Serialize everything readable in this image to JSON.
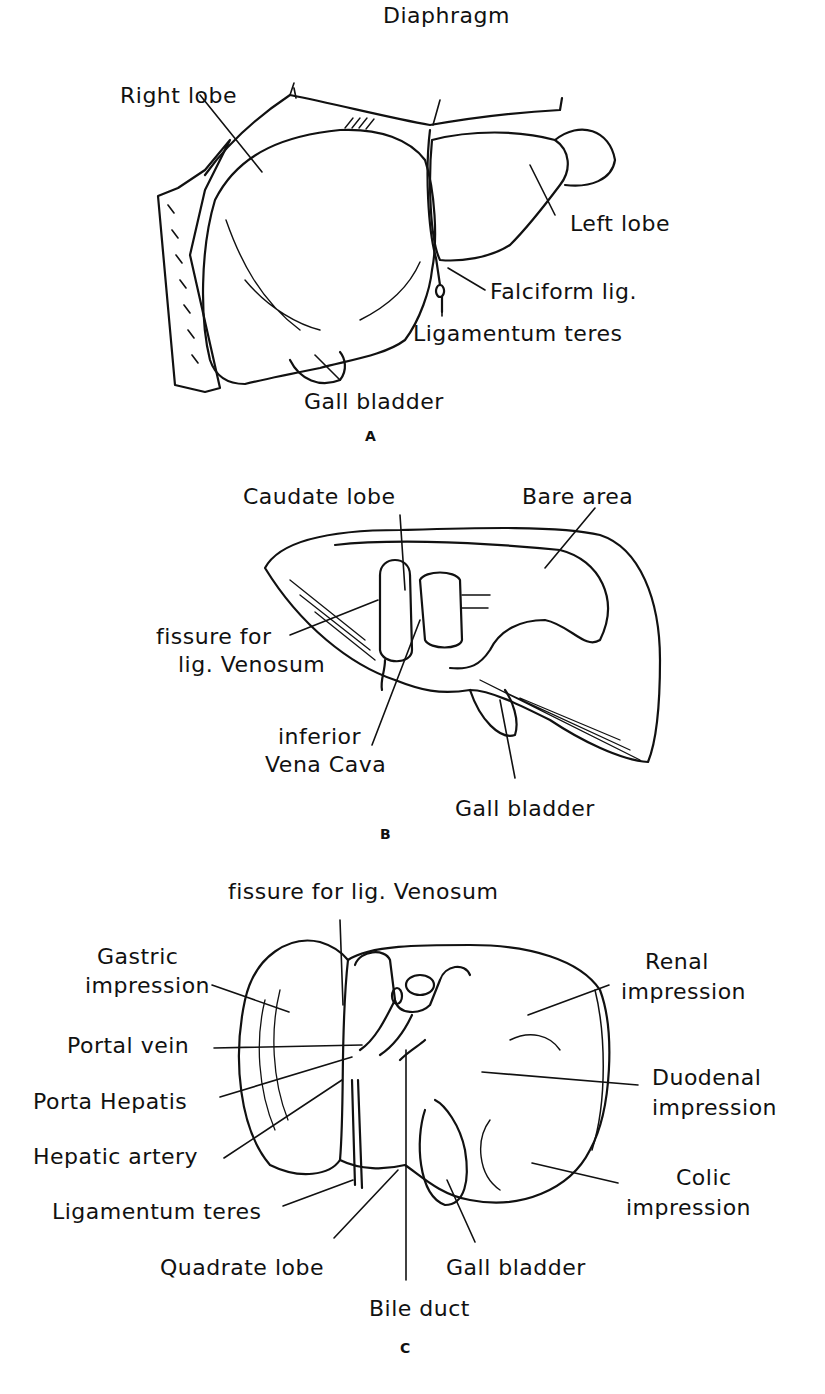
{
  "figure": {
    "ink_color": "#111111",
    "background": "#ffffff"
  },
  "panels": {
    "A": {
      "letter": "A",
      "labels": {
        "right_lobe": "Right lobe",
        "diaphragm": "Diaphragm",
        "left_lobe": "Left lobe",
        "falciform_lig": "Falciform lig.",
        "ligamentum_teres": "Ligamentum teres",
        "gall_bladder": "Gall bladder"
      }
    },
    "B": {
      "letter": "B",
      "labels": {
        "caudate_lobe": "Caudate lobe",
        "bare_area": "Bare area",
        "fissure_line1": "fissure for",
        "fissure_line2": "lig. Venosum",
        "ivc_line1": "inferior",
        "ivc_line2": "Vena Cava",
        "gall_bladder": "Gall bladder"
      }
    },
    "C": {
      "letter": "C",
      "labels": {
        "fissure_venosum": "fissure for lig. Venosum",
        "gastric_line1": "Gastric",
        "gastric_line2": "impression",
        "portal_vein": "Portal vein",
        "porta_hepatis": "Porta Hepatis",
        "hepatic_artery": "Hepatic artery",
        "ligamentum_teres": "Ligamentum teres",
        "quadrate_lobe": "Quadrate lobe",
        "bile_duct": "Bile duct",
        "gall_bladder": "Gall bladder",
        "renal_line1": "Renal",
        "renal_line2": "impression",
        "duodenal_line1": "Duodenal",
        "duodenal_line2": "impression",
        "colic_line1": "Colic",
        "colic_line2": "impression"
      }
    }
  }
}
